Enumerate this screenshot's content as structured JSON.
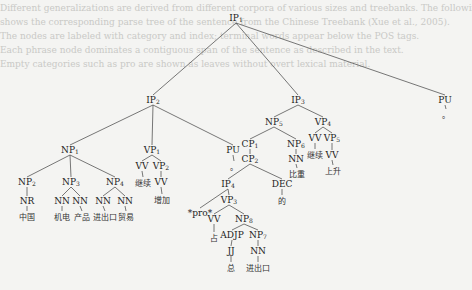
{
  "diagram": {
    "type": "syntax-tree",
    "background_color": "#f4f4f2",
    "line_color": "#555555",
    "text_color": "#222222",
    "nodes": [
      {
        "id": "IP1",
        "label": "IP",
        "sub": "1",
        "x": 236,
        "y": 18
      },
      {
        "id": "IP2",
        "label": "IP",
        "sub": "2",
        "x": 153,
        "y": 100
      },
      {
        "id": "IP3",
        "label": "IP",
        "sub": "3",
        "x": 298,
        "y": 100
      },
      {
        "id": "PU_top",
        "label": "PU",
        "sub": "",
        "x": 445,
        "y": 100
      },
      {
        "id": "NP1",
        "label": "NP",
        "sub": "1",
        "x": 70,
        "y": 150
      },
      {
        "id": "VP1",
        "label": "VP",
        "sub": "1",
        "x": 152,
        "y": 150
      },
      {
        "id": "PU_mid",
        "label": "PU",
        "sub": "",
        "x": 233,
        "y": 150
      },
      {
        "id": "NP5",
        "label": "NP",
        "sub": "5",
        "x": 274,
        "y": 122
      },
      {
        "id": "VP4",
        "label": "VP",
        "sub": "4",
        "x": 323,
        "y": 122
      },
      {
        "id": "CP1",
        "label": "CP",
        "sub": "1",
        "x": 250,
        "y": 144
      },
      {
        "id": "NP6",
        "label": "NP",
        "sub": "6",
        "x": 296,
        "y": 144
      },
      {
        "id": "VV_jixu2",
        "label": "VV",
        "sub": "",
        "x": 315,
        "y": 138
      },
      {
        "id": "VP5",
        "label": "VP",
        "sub": "5",
        "x": 332,
        "y": 138
      },
      {
        "id": "CP2",
        "label": "CP",
        "sub": "2",
        "x": 250,
        "y": 159
      },
      {
        "id": "NN_bizhong",
        "label": "NN",
        "sub": "",
        "x": 296,
        "y": 159
      },
      {
        "id": "VV_shangsheng",
        "label": "VV",
        "sub": "",
        "x": 332,
        "y": 155
      },
      {
        "id": "NP2",
        "label": "NP",
        "sub": "2",
        "x": 27,
        "y": 182
      },
      {
        "id": "NP3",
        "label": "NP",
        "sub": "3",
        "x": 71,
        "y": 182
      },
      {
        "id": "NP4",
        "label": "NP",
        "sub": "4",
        "x": 115,
        "y": 182
      },
      {
        "id": "VV_jixu1",
        "label": "VV",
        "sub": "",
        "x": 142,
        "y": 166
      },
      {
        "id": "VP2",
        "label": "VP",
        "sub": "2",
        "x": 161,
        "y": 166
      },
      {
        "id": "VV_zengjia",
        "label": "VV",
        "sub": "",
        "x": 161,
        "y": 182
      },
      {
        "id": "IP4",
        "label": "IP",
        "sub": "4",
        "x": 228,
        "y": 184
      },
      {
        "id": "DEC",
        "label": "DEC",
        "sub": "",
        "x": 282,
        "y": 184
      },
      {
        "id": "NR",
        "label": "NR",
        "sub": "",
        "x": 27,
        "y": 201
      },
      {
        "id": "NN_a",
        "label": "NN",
        "sub": "",
        "x": 62,
        "y": 201
      },
      {
        "id": "NN_b",
        "label": "NN",
        "sub": "",
        "x": 80,
        "y": 201
      },
      {
        "id": "NN_c",
        "label": "NN",
        "sub": "",
        "x": 103,
        "y": 201
      },
      {
        "id": "NN_d",
        "label": "NN",
        "sub": "",
        "x": 125,
        "y": 201
      },
      {
        "id": "VP3",
        "label": "VP",
        "sub": "3",
        "x": 229,
        "y": 200
      },
      {
        "id": "pro",
        "label": "*pro*",
        "sub": "",
        "x": 200,
        "y": 213
      },
      {
        "id": "VV_zhan",
        "label": "VV",
        "sub": "",
        "x": 214,
        "y": 219
      },
      {
        "id": "NP8",
        "label": "NP",
        "sub": "8",
        "x": 244,
        "y": 219
      },
      {
        "id": "ADJP",
        "label": "ADJP",
        "sub": "",
        "x": 232,
        "y": 235
      },
      {
        "id": "NP7",
        "label": "NP",
        "sub": "7",
        "x": 258,
        "y": 235
      },
      {
        "id": "JJ",
        "label": "JJ",
        "sub": "",
        "x": 231,
        "y": 251
      },
      {
        "id": "NN_jinchukou",
        "label": "NN",
        "sub": "",
        "x": 258,
        "y": 251
      }
    ],
    "leaves": [
      {
        "text": "中国",
        "x": 27,
        "y": 216
      },
      {
        "text": "机电",
        "x": 62,
        "y": 216
      },
      {
        "text": "产品",
        "x": 82,
        "y": 216
      },
      {
        "text": "进出口",
        "x": 105,
        "y": 216
      },
      {
        "text": "贸易",
        "x": 126,
        "y": 216
      },
      {
        "text": "继续",
        "x": 143,
        "y": 182
      },
      {
        "text": "增加",
        "x": 162,
        "y": 199
      },
      {
        "text": "。",
        "x": 234,
        "y": 166
      },
      {
        "text": "比重",
        "x": 297,
        "y": 173
      },
      {
        "text": "继续",
        "x": 315,
        "y": 154
      },
      {
        "text": "上升",
        "x": 333,
        "y": 170
      },
      {
        "text": "的",
        "x": 282,
        "y": 200
      },
      {
        "text": "占",
        "x": 214,
        "y": 237
      },
      {
        "text": "总",
        "x": 231,
        "y": 267
      },
      {
        "text": "进出口",
        "x": 258,
        "y": 267
      },
      {
        "text": "。",
        "x": 446,
        "y": 114
      }
    ],
    "edges": [
      [
        "IP1",
        "IP2"
      ],
      [
        "IP1",
        "IP3"
      ],
      [
        "IP1",
        "PU_top"
      ],
      [
        "IP2",
        "NP1"
      ],
      [
        "IP2",
        "VP1"
      ],
      [
        "IP2",
        "PU_mid"
      ],
      [
        "IP3",
        "NP5"
      ],
      [
        "IP3",
        "VP4"
      ],
      [
        "NP5",
        "CP1"
      ],
      [
        "NP5",
        "NP6"
      ],
      [
        "CP1",
        "CP2"
      ],
      [
        "NP6",
        "NN_bizhong"
      ],
      [
        "VP4",
        "VV_jixu2"
      ],
      [
        "VP4",
        "VP5"
      ],
      [
        "VP5",
        "VV_shangsheng"
      ],
      [
        "NP1",
        "NP2"
      ],
      [
        "NP1",
        "NP3"
      ],
      [
        "NP1",
        "NP4"
      ],
      [
        "NP2",
        "NR"
      ],
      [
        "NP3",
        "NN_a"
      ],
      [
        "NP3",
        "NN_b"
      ],
      [
        "NP4",
        "NN_c"
      ],
      [
        "NP4",
        "NN_d"
      ],
      [
        "VP1",
        "VV_jixu1"
      ],
      [
        "VP1",
        "VP2"
      ],
      [
        "VP2",
        "VV_zengjia"
      ],
      [
        "CP2",
        "IP4"
      ],
      [
        "CP2",
        "DEC"
      ],
      [
        "IP4",
        "pro"
      ],
      [
        "IP4",
        "VP3"
      ],
      [
        "VP3",
        "VV_zhan"
      ],
      [
        "VP3",
        "NP8"
      ],
      [
        "NP8",
        "ADJP"
      ],
      [
        "NP8",
        "NP7"
      ],
      [
        "ADJP",
        "JJ"
      ],
      [
        "NP7",
        "NN_jinchukou"
      ]
    ],
    "leaf_edges": [
      [
        "NR",
        0
      ],
      [
        "NN_a",
        1
      ],
      [
        "NN_b",
        2
      ],
      [
        "NN_c",
        3
      ],
      [
        "NN_d",
        4
      ],
      [
        "VV_jixu1",
        5
      ],
      [
        "VV_zengjia",
        6
      ],
      [
        "PU_mid",
        7
      ],
      [
        "NN_bizhong",
        8
      ],
      [
        "VV_jixu2",
        9
      ],
      [
        "VV_shangsheng",
        10
      ],
      [
        "DEC",
        11
      ],
      [
        "VV_zhan",
        12
      ],
      [
        "JJ",
        13
      ],
      [
        "NN_jinchukou",
        14
      ],
      [
        "PU_top",
        15
      ]
    ]
  }
}
